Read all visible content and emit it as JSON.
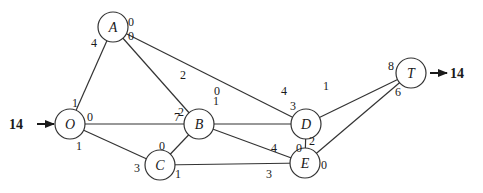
{
  "diagram": {
    "type": "network-flow",
    "source_flow": {
      "label": "14",
      "into": "O"
    },
    "sink_flow": {
      "label": "14",
      "from": "T"
    },
    "nodes": [
      {
        "id": "O",
        "label": "O",
        "x": 70,
        "y": 124
      },
      {
        "id": "A",
        "label": "A",
        "x": 113,
        "y": 27
      },
      {
        "id": "B",
        "label": "B",
        "x": 199,
        "y": 124
      },
      {
        "id": "C",
        "label": "C",
        "x": 160,
        "y": 165
      },
      {
        "id": "D",
        "label": "D",
        "x": 306,
        "y": 124
      },
      {
        "id": "E",
        "label": "E",
        "x": 305,
        "y": 163
      },
      {
        "id": "T",
        "label": "T",
        "x": 411,
        "y": 73
      }
    ],
    "edges": [
      {
        "from": "O",
        "to": "A",
        "from_label": "1",
        "to_label": "4"
      },
      {
        "from": "O",
        "to": "B",
        "from_label": "0",
        "to_label": "7"
      },
      {
        "from": "O",
        "to": "C",
        "from_label": "1",
        "to_label": "3"
      },
      {
        "from": "A",
        "to": "D",
        "from_label": "0",
        "to_label": "3"
      },
      {
        "from": "A",
        "to": "B",
        "from_label": "0",
        "to_label": "2"
      },
      {
        "from": "B",
        "to": "D",
        "from_label": "0",
        "to_label": "4"
      },
      {
        "from": "B",
        "to": "C",
        "from_label": "2",
        "to_label": "0"
      },
      {
        "from": "B",
        "to": "E",
        "from_label": "1",
        "to_label": "4"
      },
      {
        "from": "C",
        "to": "E",
        "from_label": "1",
        "to_label": "3"
      },
      {
        "from": "D",
        "to": "E",
        "from_label": "2",
        "to_label": "0"
      },
      {
        "from": "D",
        "to": "T",
        "from_label": "1",
        "to_label": "8"
      },
      {
        "from": "E",
        "to": "T",
        "from_label": "0",
        "to_label": "6"
      }
    ]
  }
}
